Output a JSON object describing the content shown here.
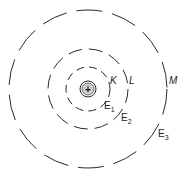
{
  "diagram": {
    "nucleus": {
      "symbol": "+",
      "fill": "#cfcfcf"
    },
    "shells": [
      {
        "name": "K",
        "energy": "E",
        "energy_sub": "1"
      },
      {
        "name": "L",
        "energy": "E",
        "energy_sub": "2"
      },
      {
        "name": "M",
        "energy": "E",
        "energy_sub": "3"
      }
    ]
  }
}
